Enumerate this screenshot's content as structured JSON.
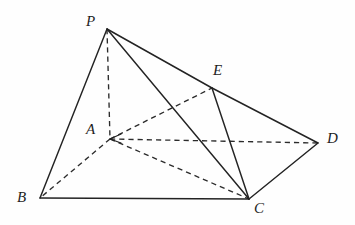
{
  "figure": {
    "canvas": {
      "width": 355,
      "height": 225
    },
    "background_color": "#fefefe",
    "stroke_color": "#232323",
    "vertices": [
      {
        "id": "P",
        "label": "P",
        "x": 107,
        "y": 29,
        "label_x": 86,
        "label_y": 14
      },
      {
        "id": "E",
        "label": "E",
        "x": 212,
        "y": 88,
        "label_x": 213,
        "label_y": 63
      },
      {
        "id": "A",
        "label": "A",
        "x": 110,
        "y": 139,
        "label_x": 86,
        "label_y": 122
      },
      {
        "id": "D",
        "label": "D",
        "x": 318,
        "y": 143,
        "label_x": 327,
        "label_y": 131
      },
      {
        "id": "B",
        "label": "B",
        "x": 40,
        "y": 198,
        "label_x": 17,
        "label_y": 190
      },
      {
        "id": "C",
        "label": "C",
        "x": 249,
        "y": 199,
        "label_x": 254,
        "label_y": 201
      }
    ],
    "edges": [
      {
        "name": "edge-P-B",
        "from": "P",
        "to": "B",
        "style": "solid",
        "hidden": false
      },
      {
        "name": "edge-P-C",
        "from": "P",
        "to": "C",
        "style": "solid",
        "hidden": false
      },
      {
        "name": "edge-P-E",
        "from": "P",
        "to": "E",
        "style": "solid",
        "hidden": false
      },
      {
        "name": "edge-E-D",
        "from": "E",
        "to": "D",
        "style": "solid",
        "hidden": false
      },
      {
        "name": "edge-E-C",
        "from": "E",
        "to": "C",
        "style": "solid",
        "hidden": false
      },
      {
        "name": "edge-B-C",
        "from": "B",
        "to": "C",
        "style": "solid",
        "hidden": false
      },
      {
        "name": "edge-C-D",
        "from": "C",
        "to": "D",
        "style": "solid",
        "hidden": false
      },
      {
        "name": "edge-P-A",
        "from": "P",
        "to": "A",
        "style": "dashed",
        "hidden": true
      },
      {
        "name": "edge-A-B",
        "from": "A",
        "to": "B",
        "style": "dashed",
        "hidden": true
      },
      {
        "name": "edge-A-C",
        "from": "A",
        "to": "C",
        "style": "dashed",
        "hidden": true
      },
      {
        "name": "edge-A-D",
        "from": "A",
        "to": "D",
        "style": "dashed",
        "hidden": true
      },
      {
        "name": "edge-A-E",
        "from": "A",
        "to": "E",
        "style": "dashed",
        "hidden": true
      }
    ],
    "arrow_marks": [
      {
        "name": "arrowhead-at-A-from-D",
        "x": 110,
        "y": 139,
        "direction": "left"
      }
    ]
  }
}
